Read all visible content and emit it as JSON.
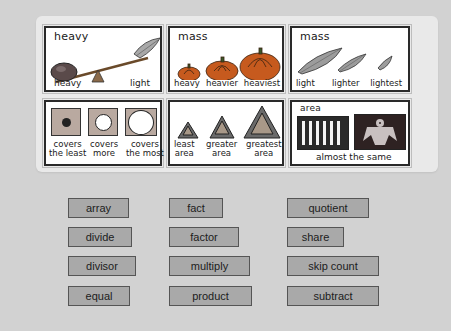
{
  "cards": [
    {
      "title": "heavy",
      "labels": [
        "heavy",
        "light"
      ]
    },
    {
      "title": "mass",
      "labels": [
        "heavy",
        "heavier",
        "heaviest"
      ]
    },
    {
      "title": "mass",
      "labels": [
        "light",
        "lighter",
        "lightest"
      ]
    },
    {
      "title": "",
      "labels": [
        "covers\nthe least",
        "covers\nmore",
        "covers\nthe most"
      ]
    },
    {
      "title": "",
      "labels": [
        "least\narea",
        "greater\narea",
        "greatest\narea"
      ]
    },
    {
      "title": "area",
      "labels": [
        "almost the same"
      ]
    }
  ],
  "words": [
    {
      "label": "array"
    },
    {
      "label": "fact"
    },
    {
      "label": "quotient"
    },
    {
      "label": "divide"
    },
    {
      "label": "factor"
    },
    {
      "label": "share"
    },
    {
      "label": "divisor"
    },
    {
      "label": "multiply"
    },
    {
      "label": "skip count"
    },
    {
      "label": "equal"
    },
    {
      "label": "product"
    },
    {
      "label": "subtract"
    }
  ],
  "colors": {
    "background": "#d2d2d2",
    "panel": "#e9e9e9",
    "button": "#a9a9a9",
    "button_border": "#555555"
  }
}
